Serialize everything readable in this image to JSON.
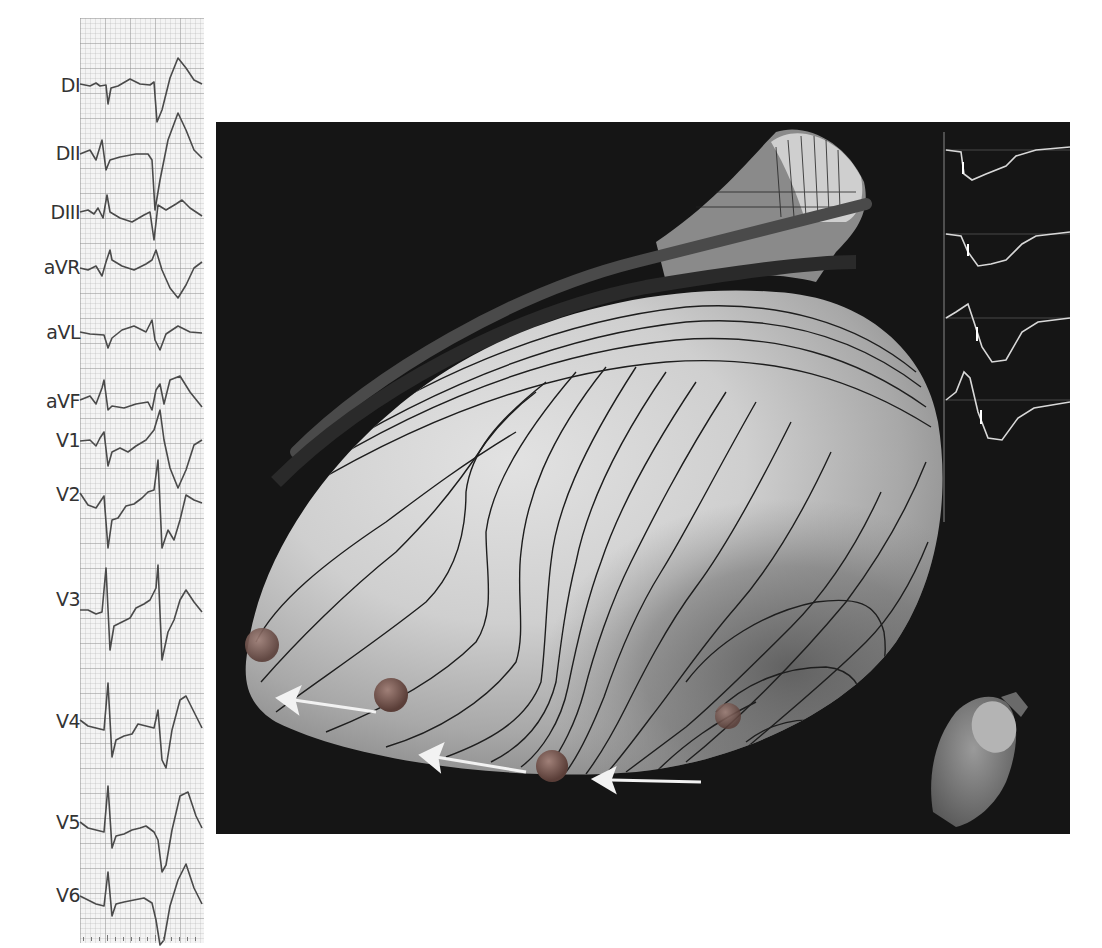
{
  "ecg": {
    "leads": [
      {
        "label": "DI",
        "y": 86
      },
      {
        "label": "DII",
        "y": 154
      },
      {
        "label": "DIII",
        "y": 213
      },
      {
        "label": "aVR",
        "y": 268
      },
      {
        "label": "aVL",
        "y": 333
      },
      {
        "label": "aVF",
        "y": 402
      },
      {
        "label": "V1",
        "y": 441
      },
      {
        "label": "V2",
        "y": 495
      },
      {
        "label": "V3",
        "y": 600
      },
      {
        "label": "V4",
        "y": 722
      },
      {
        "label": "V5",
        "y": 823
      },
      {
        "label": "V6",
        "y": 896
      }
    ]
  },
  "map": {
    "description": "3D activation map with isochronal contour lines",
    "electrode_markers": 4,
    "arrow_direction": "right-to-left",
    "inset": "small 3D orientation model",
    "electrogram_traces": 4
  },
  "colors": {
    "background": "#ffffff",
    "map_background": "#151515",
    "surface_light": "#d8d8d8",
    "surface_dark": "#6a6a6a",
    "contour": "#1e1e1e",
    "arrow": "#f2f2f2",
    "marker": "#7a5a52",
    "ecg_trace": "#4a4a4a"
  }
}
